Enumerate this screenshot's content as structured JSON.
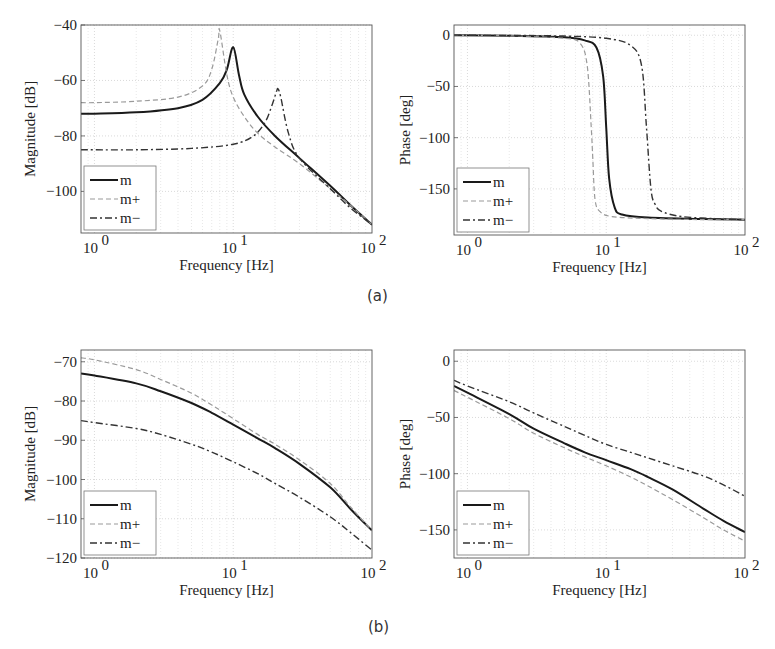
{
  "captions": {
    "a": "(a)",
    "b": "(b)"
  },
  "legend": [
    {
      "label": "m",
      "style": "solid",
      "color": "#1a1a1a",
      "width": 2.0
    },
    {
      "label": "m+",
      "style": "dashed",
      "color": "#9a9a9a",
      "width": 1.2
    },
    {
      "label": "m−",
      "style": "dashdot",
      "color": "#333333",
      "width": 1.4
    }
  ],
  "chart_data": [
    {
      "id": "a-magnitude",
      "type": "line",
      "title": "",
      "xlabel": "Frequency [Hz]",
      "ylabel": "Magnitude [dB]",
      "xscale": "log",
      "xlim": [
        0.8,
        100
      ],
      "ylim": [
        -115,
        -40
      ],
      "xticks": [
        1,
        10,
        100
      ],
      "xtick_labels": [
        "10^0",
        "10^1",
        "10^2"
      ],
      "yticks": [
        -40,
        -60,
        -80,
        -100
      ],
      "grid": true,
      "legend_position": "lower left",
      "series": [
        {
          "name": "m",
          "x": [
            0.8,
            1,
            2,
            4,
            6,
            8,
            9,
            10,
            11,
            12,
            15,
            20,
            30,
            50,
            70,
            100
          ],
          "y": [
            -72,
            -72,
            -71.5,
            -70,
            -67,
            -61,
            -56,
            -48,
            -58,
            -65,
            -73,
            -80,
            -88,
            -98,
            -105,
            -112
          ]
        },
        {
          "name": "m+",
          "x": [
            0.8,
            1,
            2,
            4,
            6,
            7,
            7.8,
            8,
            9,
            10,
            12,
            15,
            20,
            30,
            50,
            70,
            100
          ],
          "y": [
            -68,
            -68,
            -67.5,
            -66,
            -62,
            -56,
            -45,
            -42,
            -58,
            -66,
            -73,
            -79,
            -84,
            -90,
            -99,
            -105,
            -112
          ]
        },
        {
          "name": "m−",
          "x": [
            0.8,
            1,
            2,
            5,
            10,
            14,
            17,
            19,
            20.5,
            21,
            22,
            25,
            30,
            50,
            70,
            100
          ],
          "y": [
            -85,
            -85,
            -85,
            -84.5,
            -83,
            -80,
            -75,
            -69,
            -64,
            -63,
            -66,
            -79,
            -88,
            -99,
            -106,
            -112
          ]
        }
      ]
    },
    {
      "id": "a-phase",
      "type": "line",
      "title": "",
      "xlabel": "Frequency [Hz]",
      "ylabel": "Phase [deg]",
      "xscale": "log",
      "xlim": [
        0.8,
        100
      ],
      "ylim": [
        -195,
        10
      ],
      "xticks": [
        1,
        10,
        100
      ],
      "xtick_labels": [
        "10^0",
        "10^1",
        "10^2"
      ],
      "yticks": [
        0,
        -50,
        -100,
        -150
      ],
      "grid": true,
      "legend_position": "lower left",
      "series": [
        {
          "name": "m",
          "x": [
            0.8,
            2,
            5,
            7,
            8.5,
            9.5,
            10,
            10.5,
            11.5,
            13,
            20,
            50,
            100
          ],
          "y": [
            0,
            -0.5,
            -2,
            -5,
            -12,
            -40,
            -90,
            -140,
            -168,
            -175,
            -178,
            -179.5,
            -180
          ]
        },
        {
          "name": "m+",
          "x": [
            0.8,
            2,
            5,
            6.5,
            7.3,
            7.8,
            8,
            8.3,
            9,
            11,
            20,
            50,
            100
          ],
          "y": [
            0,
            -0.5,
            -3,
            -8,
            -30,
            -90,
            -120,
            -160,
            -172,
            -177,
            -179,
            -180,
            -180
          ]
        },
        {
          "name": "m−",
          "x": [
            0.8,
            2,
            5,
            10,
            15,
            18,
            19.5,
            21,
            22.5,
            25,
            35,
            60,
            100
          ],
          "y": [
            0,
            -0.2,
            -0.8,
            -3,
            -10,
            -30,
            -90,
            -150,
            -165,
            -172,
            -177,
            -179,
            -180
          ]
        }
      ]
    },
    {
      "id": "b-magnitude",
      "type": "line",
      "title": "",
      "xlabel": "Frequency [Hz]",
      "ylabel": "Magnitude [dB]",
      "xscale": "log",
      "xlim": [
        0.8,
        100
      ],
      "ylim": [
        -120,
        -67
      ],
      "xticks": [
        1,
        10,
        100
      ],
      "xtick_labels": [
        "10^0",
        "10^1",
        "10^2"
      ],
      "yticks": [
        -70,
        -80,
        -90,
        -100,
        -110,
        -120
      ],
      "grid": true,
      "legend_position": "lower left",
      "series": [
        {
          "name": "m",
          "x": [
            0.8,
            1,
            2,
            3,
            5,
            7,
            10,
            15,
            20,
            30,
            50,
            70,
            100
          ],
          "y": [
            -73,
            -73.5,
            -75.5,
            -77.5,
            -80.5,
            -83,
            -86,
            -89.5,
            -92,
            -96,
            -102,
            -107.5,
            -113
          ]
        },
        {
          "name": "m+",
          "x": [
            0.8,
            1,
            2,
            3,
            5,
            7,
            10,
            15,
            20,
            30,
            50,
            70,
            100
          ],
          "y": [
            -69,
            -69.5,
            -72,
            -74.5,
            -78,
            -81,
            -84.5,
            -88.5,
            -91,
            -95,
            -101,
            -107,
            -113
          ]
        },
        {
          "name": "m−",
          "x": [
            0.8,
            1,
            2,
            3,
            5,
            7,
            10,
            15,
            20,
            30,
            50,
            70,
            100
          ],
          "y": [
            -85,
            -85.5,
            -87,
            -88.5,
            -91,
            -93,
            -95.5,
            -98.5,
            -101,
            -104.5,
            -109.5,
            -113.5,
            -118
          ]
        }
      ]
    },
    {
      "id": "b-phase",
      "type": "line",
      "title": "",
      "xlabel": "Frequency [Hz]",
      "ylabel": "Phase [deg]",
      "xscale": "log",
      "xlim": [
        0.8,
        100
      ],
      "ylim": [
        -175,
        10
      ],
      "xticks": [
        1,
        10,
        100
      ],
      "xtick_labels": [
        "10^0",
        "10^1",
        "10^2"
      ],
      "yticks": [
        0,
        -50,
        -100,
        -150
      ],
      "grid": true,
      "legend_position": "lower left",
      "series": [
        {
          "name": "m",
          "x": [
            0.8,
            1,
            2,
            3,
            5,
            7,
            10,
            15,
            20,
            30,
            50,
            70,
            100
          ],
          "y": [
            -22,
            -28,
            -47,
            -60,
            -73,
            -81,
            -88,
            -96,
            -103,
            -114,
            -131,
            -142,
            -152
          ]
        },
        {
          "name": "m+",
          "x": [
            0.8,
            1,
            2,
            3,
            5,
            7,
            10,
            15,
            20,
            30,
            50,
            70,
            100
          ],
          "y": [
            -26,
            -32,
            -51,
            -64,
            -77,
            -85,
            -93,
            -103,
            -111,
            -123,
            -139,
            -150,
            -160
          ]
        },
        {
          "name": "m−",
          "x": [
            0.8,
            1,
            2,
            3,
            5,
            7,
            10,
            15,
            20,
            30,
            50,
            70,
            100
          ],
          "y": [
            -17,
            -22,
            -36,
            -46,
            -58,
            -66,
            -74,
            -81,
            -86,
            -93,
            -102,
            -110,
            -120
          ]
        }
      ]
    }
  ],
  "layout": {
    "panels": [
      {
        "x0": 81,
        "x1": 372,
        "y0": 25,
        "y1": 233
      },
      {
        "x0": 454,
        "x1": 745,
        "y0": 25,
        "y1": 235
      },
      {
        "x0": 81,
        "x1": 372,
        "y0": 350,
        "y1": 558
      },
      {
        "x0": 454,
        "x1": 745,
        "y0": 350,
        "y1": 558
      }
    ]
  }
}
